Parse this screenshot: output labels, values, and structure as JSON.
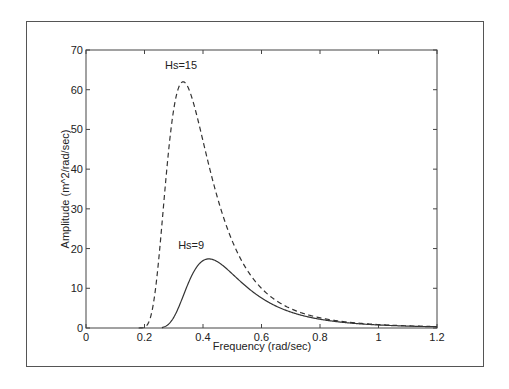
{
  "chart_data": {
    "type": "line",
    "title": "",
    "xlabel": "Frequency (rad/sec)",
    "ylabel": "Amplitude (m^2/rad/sec)",
    "xlim": [
      0,
      1.2
    ],
    "ylim": [
      0,
      70
    ],
    "xticks": [
      0,
      0.2,
      0.4,
      0.6,
      0.8,
      1.0,
      1.2
    ],
    "xtick_labels": [
      "0",
      "0.2",
      "0.4",
      "0.6",
      "0.8",
      "1",
      "1.2"
    ],
    "yticks": [
      0,
      10,
      20,
      30,
      40,
      50,
      60,
      70
    ],
    "ytick_labels": [
      "0",
      "10",
      "20",
      "30",
      "40",
      "50",
      "60",
      "70"
    ],
    "grid": false,
    "legend": null,
    "series": [
      {
        "name": "Hs=15",
        "style": "dashed",
        "color": "#333333",
        "peak": {
          "x": 0.332,
          "y": 62
        },
        "x": [
          0.18,
          0.2,
          0.22,
          0.24,
          0.26,
          0.28,
          0.3,
          0.32,
          0.33,
          0.34,
          0.36,
          0.38,
          0.4,
          0.42,
          0.44,
          0.46,
          0.48,
          0.5,
          0.55,
          0.6,
          0.65,
          0.7,
          0.75,
          0.8,
          0.9,
          1.0,
          1.1,
          1.2
        ],
        "values": [
          0.0,
          0.8,
          4.6,
          13.3,
          26.0,
          40.1,
          52.3,
          60.1,
          61.8,
          61.9,
          59.4,
          54.1,
          47.6,
          40.9,
          34.6,
          29.0,
          24.3,
          20.3,
          13.0,
          8.6,
          5.9,
          4.2,
          3.0,
          2.2,
          1.3,
          0.86,
          0.53,
          0.35
        ]
      },
      {
        "name": "Hs=9",
        "style": "solid",
        "color": "#333333",
        "peak": {
          "x": 0.42,
          "y": 17.4
        },
        "x": [
          0.26,
          0.28,
          0.3,
          0.32,
          0.34,
          0.36,
          0.38,
          0.4,
          0.42,
          0.44,
          0.46,
          0.48,
          0.5,
          0.55,
          0.6,
          0.65,
          0.7,
          0.75,
          0.8,
          0.9,
          1.0,
          1.1,
          1.2
        ],
        "values": [
          0.0,
          0.5,
          1.8,
          4.3,
          7.8,
          11.3,
          14.4,
          16.5,
          17.4,
          17.3,
          16.6,
          15.5,
          14.1,
          10.9,
          8.2,
          6.1,
          4.6,
          3.5,
          2.6,
          1.6,
          0.76,
          0.48,
          0.32
        ]
      }
    ],
    "annotations": [
      {
        "text": "Hs=15",
        "x": 0.27,
        "y": 65.3
      },
      {
        "text": "Hs=9",
        "x": 0.315,
        "y": 20.0
      }
    ]
  }
}
